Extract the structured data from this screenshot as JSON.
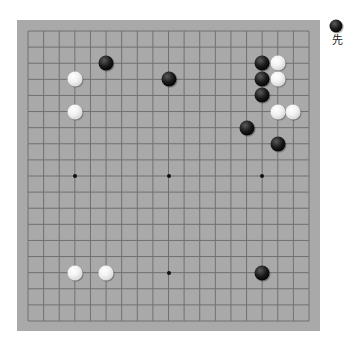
{
  "board": {
    "size": 19,
    "colors": {
      "board": "#a9a9a9",
      "line": "#707070",
      "star": "#111111"
    },
    "star_points": [
      [
        3,
        3
      ],
      [
        9,
        3
      ],
      [
        15,
        3
      ],
      [
        3,
        9
      ],
      [
        9,
        9
      ],
      [
        15,
        9
      ],
      [
        3,
        15
      ],
      [
        9,
        15
      ],
      [
        15,
        15
      ]
    ],
    "stones": [
      {
        "color": "black",
        "col": 5,
        "row": 2
      },
      {
        "color": "black",
        "col": 9,
        "row": 3
      },
      {
        "color": "white",
        "col": 3,
        "row": 3
      },
      {
        "color": "white",
        "col": 3,
        "row": 5
      },
      {
        "color": "black",
        "col": 15,
        "row": 2
      },
      {
        "color": "white",
        "col": 16,
        "row": 2
      },
      {
        "color": "black",
        "col": 15,
        "row": 3
      },
      {
        "color": "white",
        "col": 16,
        "row": 3
      },
      {
        "color": "black",
        "col": 15,
        "row": 4
      },
      {
        "color": "white",
        "col": 16,
        "row": 5
      },
      {
        "color": "white",
        "col": 17,
        "row": 5
      },
      {
        "color": "black",
        "col": 14,
        "row": 6
      },
      {
        "color": "black",
        "col": 16,
        "row": 7
      },
      {
        "color": "white",
        "col": 3,
        "row": 15
      },
      {
        "color": "white",
        "col": 5,
        "row": 15
      },
      {
        "color": "black",
        "col": 15,
        "row": 15
      }
    ]
  },
  "turn_indicator": {
    "stone_color": "black",
    "label": "先"
  }
}
